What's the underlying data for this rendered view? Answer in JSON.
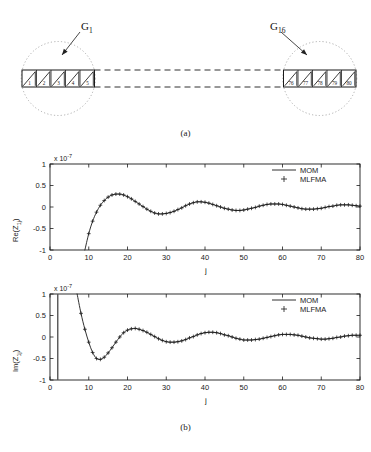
{
  "figure": {
    "panel_a": {
      "caption": "(a)",
      "groups": [
        {
          "id": "G1",
          "label_text": "G",
          "label_sub": "1",
          "cells": [
            "1",
            "2",
            "3",
            "4",
            "5"
          ]
        },
        {
          "id": "G16",
          "label_text": "G",
          "label_sub": "16",
          "cells": [
            "76",
            "77",
            "78",
            "79",
            "80"
          ]
        }
      ]
    },
    "panel_b": {
      "caption": "(b)"
    }
  },
  "chart_data": [
    {
      "type": "line",
      "id": "real-part-plot",
      "title": "",
      "xlabel": "j",
      "ylabel": "Re(Z_1j)",
      "ylabel_base": "Re(Z",
      "ylabel_sub": "1j",
      "ylabel_tail": ")",
      "y_multiplier": "x 10",
      "y_multiplier_exp": "-7",
      "xlim": [
        0,
        80
      ],
      "ylim": [
        -1,
        1
      ],
      "xticks": [
        0,
        10,
        20,
        30,
        40,
        50,
        60,
        70,
        80
      ],
      "xticklabels": [
        "0",
        "10",
        "20",
        "30",
        "40",
        "50",
        "60",
        "70",
        "80"
      ],
      "yticks": [
        -1,
        -0.5,
        0,
        0.5,
        1
      ],
      "yticklabels": [
        "-1",
        "-0.5",
        "0",
        "0.5",
        "1"
      ],
      "grid": false,
      "legend_position": "upper right",
      "series": [
        {
          "name": "MOM",
          "style": "solid-line",
          "color": "#1a1a1a",
          "x": [
            9,
            10,
            11,
            12,
            13,
            14,
            15,
            16,
            17,
            18,
            19,
            20,
            21,
            22,
            23,
            24,
            25,
            26,
            27,
            28,
            29,
            30,
            31,
            32,
            33,
            34,
            35,
            36,
            37,
            38,
            39,
            40,
            41,
            42,
            43,
            44,
            45,
            46,
            47,
            48,
            49,
            50,
            51,
            52,
            53,
            54,
            55,
            56,
            57,
            58,
            59,
            60,
            61,
            62,
            63,
            64,
            65,
            66,
            67,
            68,
            69,
            70,
            71,
            72,
            73,
            74,
            75,
            76,
            77,
            78,
            79,
            80
          ],
          "values": [
            -1.0,
            -0.62,
            -0.33,
            -0.12,
            0.04,
            0.15,
            0.23,
            0.28,
            0.3,
            0.3,
            0.28,
            0.24,
            0.19,
            0.13,
            0.07,
            0.01,
            -0.05,
            -0.1,
            -0.14,
            -0.16,
            -0.16,
            -0.15,
            -0.13,
            -0.1,
            -0.06,
            -0.02,
            0.03,
            0.07,
            0.1,
            0.12,
            0.12,
            0.11,
            0.09,
            0.06,
            0.03,
            0.0,
            -0.03,
            -0.05,
            -0.07,
            -0.08,
            -0.08,
            -0.07,
            -0.05,
            -0.03,
            -0.01,
            0.02,
            0.04,
            0.06,
            0.07,
            0.07,
            0.07,
            0.06,
            0.04,
            0.02,
            0.0,
            -0.02,
            -0.04,
            -0.05,
            -0.05,
            -0.05,
            -0.04,
            -0.03,
            -0.01,
            0.01,
            0.02,
            0.04,
            0.05,
            0.05,
            0.05,
            0.04,
            0.03,
            0.02
          ]
        },
        {
          "name": "MLFMA",
          "style": "plus-marker",
          "color": "#1a1a1a",
          "x": [
            10,
            11,
            12,
            13,
            14,
            15,
            16,
            17,
            18,
            19,
            20,
            21,
            22,
            23,
            24,
            25,
            26,
            27,
            28,
            29,
            30,
            31,
            32,
            33,
            34,
            35,
            36,
            37,
            38,
            39,
            40,
            41,
            42,
            43,
            44,
            45,
            46,
            47,
            48,
            49,
            50,
            51,
            52,
            53,
            54,
            55,
            56,
            57,
            58,
            59,
            60,
            61,
            62,
            63,
            64,
            65,
            66,
            67,
            68,
            69,
            70,
            71,
            72,
            73,
            74,
            75,
            76,
            77,
            78,
            79,
            80
          ],
          "values": [
            -0.62,
            -0.33,
            -0.12,
            0.04,
            0.15,
            0.23,
            0.28,
            0.3,
            0.3,
            0.28,
            0.24,
            0.19,
            0.13,
            0.07,
            0.01,
            -0.05,
            -0.1,
            -0.14,
            -0.16,
            -0.16,
            -0.15,
            -0.13,
            -0.1,
            -0.06,
            -0.02,
            0.03,
            0.07,
            0.1,
            0.12,
            0.12,
            0.11,
            0.09,
            0.06,
            0.03,
            0.0,
            -0.03,
            -0.05,
            -0.07,
            -0.08,
            -0.08,
            -0.07,
            -0.05,
            -0.03,
            -0.01,
            0.02,
            0.04,
            0.06,
            0.07,
            0.07,
            0.07,
            0.06,
            0.04,
            0.02,
            0.0,
            -0.02,
            -0.04,
            -0.05,
            -0.05,
            -0.05,
            -0.04,
            -0.03,
            -0.01,
            0.01,
            0.02,
            0.04,
            0.05,
            0.05,
            0.05,
            0.04,
            0.03,
            0.02
          ]
        }
      ]
    },
    {
      "type": "line",
      "id": "imag-part-plot",
      "title": "",
      "xlabel": "j",
      "ylabel": "Im(Z_1j)",
      "ylabel_base": "Im(Z",
      "ylabel_sub": "1j",
      "ylabel_tail": ")",
      "y_multiplier": "x 10",
      "y_multiplier_exp": "-7",
      "xlim": [
        0,
        80
      ],
      "ylim": [
        -1,
        1
      ],
      "xticks": [
        0,
        10,
        20,
        30,
        40,
        50,
        60,
        70,
        80
      ],
      "xticklabels": [
        "0",
        "10",
        "20",
        "30",
        "40",
        "50",
        "60",
        "70",
        "80"
      ],
      "yticks": [
        -1,
        -0.5,
        0,
        0.5,
        1
      ],
      "yticklabels": [
        "-1",
        "-0.5",
        "0",
        "0.5",
        "1"
      ],
      "grid": false,
      "legend_position": "upper right",
      "asymptote_x": 2,
      "series": [
        {
          "name": "MOM",
          "style": "solid-line",
          "color": "#1a1a1a",
          "x": [
            7,
            8,
            9,
            10,
            11,
            12,
            13,
            14,
            15,
            16,
            17,
            18,
            19,
            20,
            21,
            22,
            23,
            24,
            25,
            26,
            27,
            28,
            29,
            30,
            31,
            32,
            33,
            34,
            35,
            36,
            37,
            38,
            39,
            40,
            41,
            42,
            43,
            44,
            45,
            46,
            47,
            48,
            49,
            50,
            51,
            52,
            53,
            54,
            55,
            56,
            57,
            58,
            59,
            60,
            61,
            62,
            63,
            64,
            65,
            66,
            67,
            68,
            69,
            70,
            71,
            72,
            73,
            74,
            75,
            76,
            77,
            78,
            79,
            80
          ],
          "values": [
            1.0,
            0.55,
            0.18,
            -0.12,
            -0.36,
            -0.5,
            -0.52,
            -0.47,
            -0.37,
            -0.25,
            -0.12,
            0.0,
            0.1,
            0.16,
            0.19,
            0.2,
            0.18,
            0.15,
            0.11,
            0.06,
            0.01,
            -0.04,
            -0.08,
            -0.11,
            -0.12,
            -0.12,
            -0.11,
            -0.09,
            -0.06,
            -0.02,
            0.01,
            0.05,
            0.08,
            0.1,
            0.11,
            0.11,
            0.1,
            0.08,
            0.05,
            0.03,
            0.0,
            -0.03,
            -0.05,
            -0.07,
            -0.07,
            -0.07,
            -0.06,
            -0.05,
            -0.03,
            -0.01,
            0.01,
            0.03,
            0.05,
            0.06,
            0.06,
            0.06,
            0.05,
            0.04,
            0.02,
            0.0,
            -0.02,
            -0.03,
            -0.04,
            -0.05,
            -0.05,
            -0.04,
            -0.03,
            -0.01,
            0.0,
            0.02,
            0.03,
            0.04,
            0.04,
            0.04
          ]
        },
        {
          "name": "MLFMA",
          "style": "plus-marker",
          "color": "#1a1a1a",
          "x": [
            8,
            9,
            10,
            11,
            12,
            13,
            14,
            15,
            16,
            17,
            18,
            19,
            20,
            21,
            22,
            23,
            24,
            25,
            26,
            27,
            28,
            29,
            30,
            31,
            32,
            33,
            34,
            35,
            36,
            37,
            38,
            39,
            40,
            41,
            42,
            43,
            44,
            45,
            46,
            47,
            48,
            49,
            50,
            51,
            52,
            53,
            54,
            55,
            56,
            57,
            58,
            59,
            60,
            61,
            62,
            63,
            64,
            65,
            66,
            67,
            68,
            69,
            70,
            71,
            72,
            73,
            74,
            75,
            76,
            77,
            78,
            79,
            80
          ],
          "values": [
            0.55,
            0.18,
            -0.12,
            -0.36,
            -0.5,
            -0.52,
            -0.47,
            -0.37,
            -0.25,
            -0.12,
            0.0,
            0.1,
            0.16,
            0.19,
            0.2,
            0.18,
            0.15,
            0.11,
            0.06,
            0.01,
            -0.04,
            -0.08,
            -0.11,
            -0.12,
            -0.12,
            -0.11,
            -0.09,
            -0.06,
            -0.02,
            0.01,
            0.05,
            0.08,
            0.1,
            0.11,
            0.11,
            0.1,
            0.08,
            0.05,
            0.03,
            0.0,
            -0.03,
            -0.05,
            -0.07,
            -0.07,
            -0.07,
            -0.06,
            -0.05,
            -0.03,
            -0.01,
            0.01,
            0.03,
            0.05,
            0.06,
            0.06,
            0.06,
            0.05,
            0.04,
            0.02,
            0.0,
            -0.02,
            -0.03,
            -0.04,
            -0.05,
            -0.05,
            -0.04,
            -0.03,
            -0.01,
            0.0,
            0.02,
            0.03,
            0.04,
            0.04,
            0.04
          ]
        }
      ]
    }
  ]
}
